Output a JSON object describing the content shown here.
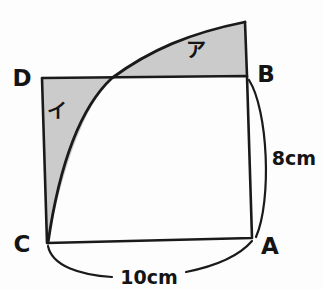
{
  "figure": {
    "background_color": "#fdfdfd",
    "line_color": "#1a1a1a",
    "shade_color": "#cbcbcb",
    "vertices": [
      {
        "name": "D",
        "label": "D",
        "x": 42,
        "y": 78,
        "label_x": 22,
        "label_y": 86
      },
      {
        "name": "B",
        "label": "B",
        "x": 247,
        "y": 76,
        "label_x": 258,
        "label_y": 82
      },
      {
        "name": "C",
        "label": "C",
        "x": 47,
        "y": 243,
        "label_x": 22,
        "label_y": 252
      },
      {
        "name": "A",
        "label": "A",
        "x": 252,
        "y": 238,
        "label_x": 262,
        "label_y": 254
      }
    ],
    "regions": [
      {
        "name": "region-a",
        "label": "ア",
        "label_x": 196,
        "label_y": 57
      },
      {
        "name": "region-i",
        "label": "イ",
        "label_x": 57,
        "label_y": 118
      }
    ],
    "dimensions": [
      {
        "name": "height",
        "label": "8cm",
        "label_x": 268,
        "label_y": 165
      },
      {
        "name": "width",
        "label": "10cm",
        "label_x": 118,
        "label_y": 284
      }
    ],
    "arc": {
      "center": "C",
      "radius_label": "10cm",
      "from": "A",
      "crossing_x": 112,
      "crossing_y": 78,
      "apex_x": 245,
      "apex_y": 22
    }
  }
}
